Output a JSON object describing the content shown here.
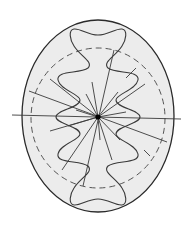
{
  "figure": {
    "colors": {
      "background": "#ffffff",
      "fill": "#ececec",
      "stroke": "#3a3a3a",
      "dashed": "#555555",
      "center": "#000000"
    }
  }
}
